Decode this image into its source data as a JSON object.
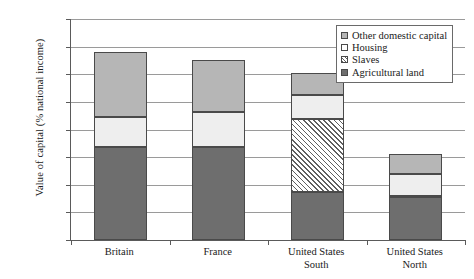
{
  "chart_data": {
    "type": "bar",
    "subtype": "stacked-bar",
    "title": "",
    "xlabel": "",
    "ylabel": "Value of capital (% national income)",
    "ylim": [
      0,
      800
    ],
    "ytick_values": [
      0,
      100,
      200,
      300,
      400,
      500,
      600,
      700,
      800
    ],
    "ytick_labels": [
      "0%",
      "100%",
      "200%",
      "300%",
      "400%",
      "500%",
      "600%",
      "700%",
      "800%"
    ],
    "grid": true,
    "legend_position": "top-right",
    "categories": [
      "Britain",
      "France",
      "United States South",
      "United States North"
    ],
    "category_label_lines": [
      [
        "Britain"
      ],
      [
        "France"
      ],
      [
        "United States",
        "South"
      ],
      [
        "United States",
        "North"
      ]
    ],
    "series": [
      {
        "name": "Agricultural land",
        "color": "#6e6e6e",
        "pattern": "solid",
        "values": [
          335,
          337,
          175,
          155
        ]
      },
      {
        "name": "Slaves",
        "color": "#ffffff",
        "pattern": "diagonal-hatch",
        "values": [
          0,
          0,
          262,
          5
        ]
      },
      {
        "name": "Housing",
        "color": "#eeeeee",
        "pattern": "solid",
        "values": [
          110,
          128,
          88,
          80
        ]
      },
      {
        "name": "Other domestic capital",
        "color": "#b6b6b6",
        "pattern": "solid",
        "values": [
          235,
          185,
          78,
          73
        ]
      }
    ],
    "stack_order": [
      "Agricultural land",
      "Slaves",
      "Housing",
      "Other domestic capital"
    ],
    "totals": [
      680,
      650,
      603,
      313
    ]
  },
  "legend": {
    "items": [
      {
        "label": "Other domestic capital",
        "swatch": "other-domestic-capital-swatch"
      },
      {
        "label": "Housing",
        "swatch": "housing-swatch"
      },
      {
        "label": "Slaves",
        "swatch": "slaves-swatch"
      },
      {
        "label": "Agricultural land",
        "swatch": "agricultural-land-swatch"
      }
    ]
  },
  "colors": {
    "agricultural_land": "#6e6e6e",
    "housing": "#eeeeee",
    "other_domestic_capital": "#b6b6b6",
    "slaves_hatch": "#5f5f5f",
    "axis": "#5a5a5a",
    "gridline": "#9a9a9a",
    "background": "#ffffff"
  }
}
